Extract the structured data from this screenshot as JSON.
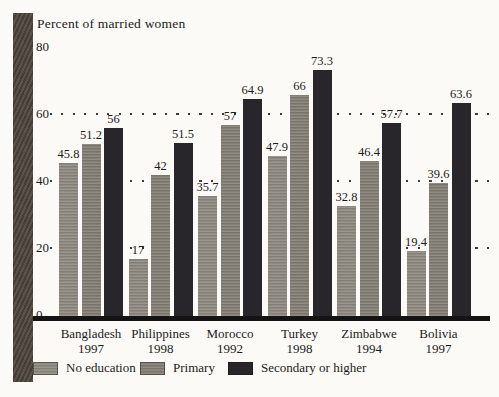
{
  "title": "Percent of married women",
  "chart_data": {
    "type": "bar",
    "title": "Percent of married women",
    "categories": [
      "Bangladesh",
      "Philippines",
      "Morocco",
      "Turkey",
      "Zimbabwe",
      "Bolivia"
    ],
    "category_years": [
      "1997",
      "1998",
      "1992",
      "1998",
      "1994",
      "1997"
    ],
    "series": [
      {
        "name": "No education",
        "color": "#8f8a80",
        "values": [
          45.8,
          17,
          35.7,
          47.9,
          32.8,
          19.4
        ]
      },
      {
        "name": "Primary",
        "color": "#837e75",
        "values": [
          51.2,
          42,
          57,
          66,
          46.4,
          39.6
        ]
      },
      {
        "name": "Secondary or higher",
        "color": "#28262b",
        "values": [
          56,
          51.5,
          64.9,
          73.3,
          57.7,
          63.6
        ]
      }
    ],
    "ylabel": "Percent of married women",
    "xlabel": "",
    "ylim": [
      0,
      85
    ],
    "yticks": [
      0,
      20,
      40,
      60,
      80
    ],
    "gridlines_at": [
      20,
      40,
      60
    ],
    "grid_style": "dotted",
    "legend_position": "bottom",
    "bar_labels_shown": true
  },
  "colors": {
    "background": "#fbfaf6",
    "left_band": "#4e453d",
    "baseline": "#141414",
    "grid_dot": "#3d3d3d",
    "text": "#1b1b1b"
  }
}
